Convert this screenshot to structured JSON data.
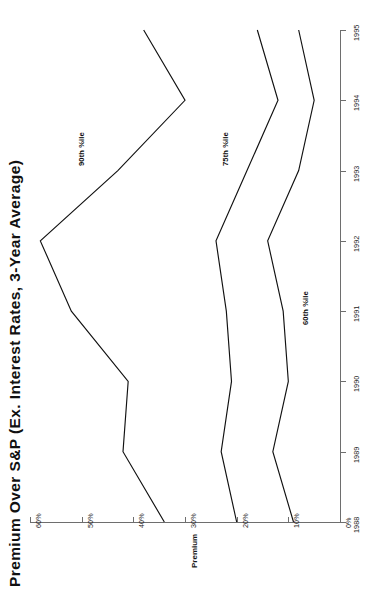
{
  "chart_title": "Premium Over S&P (Ex. Interest Rates, 3-Year Average)",
  "value_axis_title": "Premium",
  "orientation": "rotated-90-ccw",
  "axes": {
    "value_ticks": [
      "0%",
      "10%",
      "20%",
      "30%",
      "40%",
      "50%",
      "60%"
    ],
    "category_ticks": [
      "1988",
      "1989",
      "1990",
      "1991",
      "1992",
      "1993",
      "1994",
      "1995"
    ]
  },
  "series_labels": {
    "p90": "90th %ile",
    "p75": "75th %ile",
    "p60": "60th %ile"
  },
  "chart_data": {
    "type": "line",
    "title": "Premium Over S&P (Ex. Interest Rates, 3-Year Average)",
    "xlabel": "",
    "ylabel": "Premium",
    "x": [
      1988,
      1989,
      1990,
      1991,
      1992,
      1993,
      1994,
      1995
    ],
    "categories": [
      "1988",
      "1989",
      "1990",
      "1991",
      "1992",
      "1993",
      "1994",
      "1995"
    ],
    "ylim": [
      0,
      60
    ],
    "ytick_values": [
      0,
      10,
      20,
      30,
      40,
      50,
      60
    ],
    "ytick_labels": [
      "0%",
      "10%",
      "20%",
      "30%",
      "40%",
      "50%",
      "60%"
    ],
    "grid": false,
    "legend": "inline-annotations",
    "units": "percent",
    "series": [
      {
        "name": "90th %ile",
        "values": [
          34,
          42,
          41,
          52,
          58,
          43,
          30,
          38
        ]
      },
      {
        "name": "75th %ile",
        "values": [
          20,
          23,
          21,
          22,
          24,
          18,
          12,
          16
        ]
      },
      {
        "name": "60th %ile",
        "values": [
          9,
          13,
          10,
          11,
          14,
          8,
          5,
          8
        ]
      }
    ],
    "annotations": [
      {
        "text": "90th %ile",
        "series": "90th %ile",
        "near_x": 1993
      },
      {
        "text": "75th %ile",
        "series": "75th %ile",
        "near_x": 1993
      },
      {
        "text": "60th %ile",
        "series": "60th %ile",
        "near_x": 1991
      }
    ]
  }
}
